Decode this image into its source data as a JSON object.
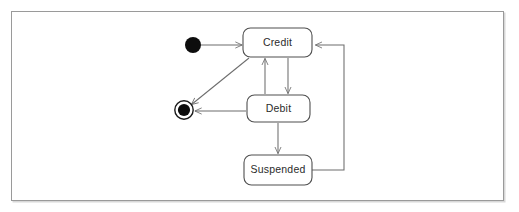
{
  "diagram": {
    "kind": "uml-state-machine-diagram",
    "frame": {
      "border_color": "#9a9a9a",
      "background": "#ffffff"
    },
    "states": [
      {
        "id": "credit",
        "label": "Credit",
        "x": 243,
        "y": 28,
        "w": 69,
        "h": 29
      },
      {
        "id": "debit",
        "label": "Debit",
        "x": 247,
        "y": 95,
        "w": 63,
        "h": 27
      },
      {
        "id": "suspended",
        "label": "Suspended",
        "x": 244,
        "y": 155,
        "w": 68,
        "h": 30
      }
    ],
    "pseudostates": [
      {
        "id": "initial",
        "kind": "initial-state",
        "cx": 193,
        "cy": 45,
        "r": 8
      },
      {
        "id": "final",
        "kind": "final-state",
        "cx": 184,
        "cy": 110,
        "r_outer": 9,
        "r_inner": 6
      }
    ],
    "transitions": [
      {
        "id": "initial-to-credit",
        "from": "initial",
        "to": "credit"
      },
      {
        "id": "credit-to-debit",
        "from": "credit",
        "to": "debit"
      },
      {
        "id": "debit-to-credit",
        "from": "debit",
        "to": "credit"
      },
      {
        "id": "debit-to-suspended",
        "from": "debit",
        "to": "suspended"
      },
      {
        "id": "suspended-to-credit",
        "from": "suspended",
        "to": "credit"
      },
      {
        "id": "credit-to-final",
        "from": "credit",
        "to": "final"
      },
      {
        "id": "debit-to-final",
        "from": "debit",
        "to": "final"
      }
    ],
    "colors": {
      "state_stroke": "#4f4f4f",
      "edge_stroke": "#6d6d6d",
      "label_color": "#2b2b2b",
      "pseudostate_fill": "#0d0d0d"
    }
  }
}
